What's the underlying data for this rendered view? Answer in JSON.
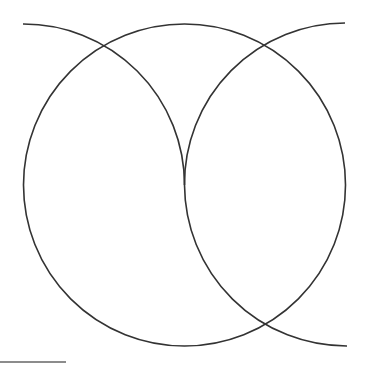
{
  "diagram": {
    "width": 368,
    "height": 368,
    "background": "#ffffff",
    "stroke_color": "#333333",
    "stroke_width": 1.6,
    "shapes": {
      "main_circle": {
        "cx": 184.5,
        "cy": 185,
        "r": 161
      },
      "top_left_arc": {
        "from": [
          23,
          24
        ],
        "to": [
          184.5,
          185
        ],
        "r": 161,
        "center": [
          23,
          185
        ]
      },
      "top_right_arc": {
        "from": [
          345,
          23
        ],
        "to": [
          184.5,
          185
        ],
        "r": 161,
        "center": [
          345,
          185
        ]
      },
      "bottom_right_arc": {
        "from": [
          184.5,
          185
        ],
        "to": [
          347,
          346
        ],
        "r": 162,
        "center": [
          347,
          185
        ]
      },
      "bottom_left_line": {
        "x1": 0,
        "y1": 362,
        "x2": 66,
        "y2": 362,
        "color": "#666666"
      }
    }
  }
}
